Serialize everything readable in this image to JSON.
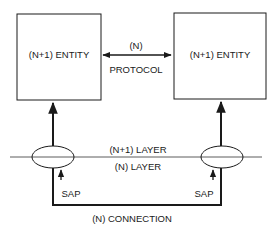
{
  "diagram": {
    "left_entity": {
      "label": "(N+1) ENTITY"
    },
    "right_entity": {
      "label": "(N+1) ENTITY"
    },
    "protocol": {
      "top_label": "(N)",
      "bottom_label": "PROTOCOL"
    },
    "layers": {
      "upper_label": "(N+1) LAYER",
      "lower_label": "(N) LAYER"
    },
    "left_sap": {
      "label": "SAP"
    },
    "right_sap": {
      "label": "SAP"
    },
    "connection": {
      "label": "(N) CONNECTION"
    },
    "colors": {
      "line": "#1a1a1a",
      "background": "#ffffff"
    }
  }
}
